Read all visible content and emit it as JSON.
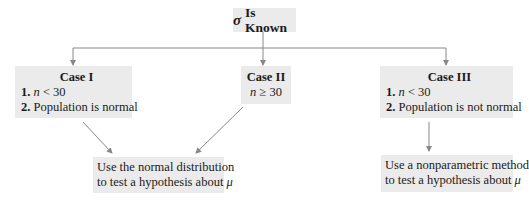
{
  "root": {
    "symbol": "σ",
    "label": "Is Known"
  },
  "cases": [
    {
      "title": "Case I",
      "conditions": [
        {
          "num": "1.",
          "var": "n",
          "rel": " < 30"
        },
        {
          "num": "2.",
          "text": " Population is normal"
        }
      ]
    },
    {
      "title": "Case II",
      "conditions": [
        {
          "var": "n",
          "rel": " ≥ 30"
        }
      ]
    },
    {
      "title": "Case III",
      "conditions": [
        {
          "num": "1.",
          "var": "n",
          "rel": " < 30"
        },
        {
          "num": "2.",
          "text": " Population is not normal"
        }
      ]
    }
  ],
  "results": {
    "normal": {
      "line1": "Use the normal distribution",
      "line2_text": "to test a hypothesis about ",
      "line2_symbol": "μ"
    },
    "nonparametric": {
      "line1": "Use a nonparametric method",
      "line2_text": "to test a hypothesis about ",
      "line2_symbol": "μ"
    }
  },
  "colors": {
    "box_fill": "#ebebeb",
    "connector": "#888888",
    "text": "#1a1a1a"
  }
}
